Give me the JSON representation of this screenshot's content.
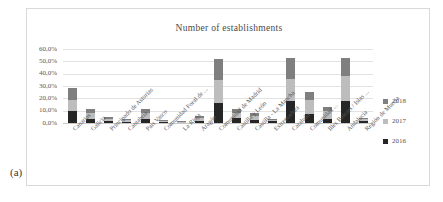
{
  "figure": {
    "panel_label": "(a)"
  },
  "chart_data": {
    "type": "bar",
    "subtype": "stacked-column",
    "title": "Number of establishments",
    "xlabel": "",
    "ylabel": "",
    "ylim": [
      0,
      60
    ],
    "yticks": [
      0,
      10,
      20,
      30,
      40,
      50,
      60
    ],
    "ytick_labels": [
      "0,0%",
      "10,0%",
      "20,0%",
      "30,0%",
      "40,0%",
      "50,0%",
      "60,0%"
    ],
    "grid": true,
    "legend_position": "right",
    "categories": [
      "Canarias",
      "Galicia",
      "Principado de Asturias",
      "Cantabria",
      "País Vasco",
      "Comunidad Foral de ...",
      "La Rioja",
      "Aragón",
      "Comunidad de Madrid",
      "Castilla y León",
      "Castilla - La Mancha",
      "Extremadura",
      "Cataluña",
      "Comunidad ...",
      "Illes Balears / Islas ...",
      "Andalucía",
      "Región de Murcia"
    ],
    "series": [
      {
        "name": "2016",
        "color": "#262626",
        "values": [
          9.5,
          3.5,
          2.0,
          1.2,
          3.5,
          1.0,
          0.6,
          2.0,
          16.0,
          4.0,
          2.5,
          1.5,
          17.5,
          7.0,
          3.5,
          18.0,
          1.4
        ]
      },
      {
        "name": "2017",
        "color": "#bdbdbd",
        "values": [
          9.0,
          4.5,
          1.5,
          1.0,
          5.0,
          0.8,
          0.4,
          2.0,
          19.0,
          4.5,
          3.5,
          1.0,
          18.5,
          11.5,
          6.0,
          20.0,
          1.6
        ]
      },
      {
        "name": "2018",
        "color": "#7f7f7f",
        "values": [
          9.5,
          3.0,
          1.0,
          0.8,
          3.0,
          0.7,
          0.3,
          1.5,
          17.0,
          3.0,
          2.0,
          0.8,
          17.0,
          7.0,
          3.5,
          15.0,
          1.0
        ]
      }
    ],
    "totals": [
      28.0,
      11.0,
      4.5,
      3.0,
      11.5,
      2.5,
      1.3,
      5.5,
      52.0,
      11.5,
      8.0,
      3.3,
      53.0,
      25.5,
      13.0,
      53.0,
      4.0
    ]
  }
}
